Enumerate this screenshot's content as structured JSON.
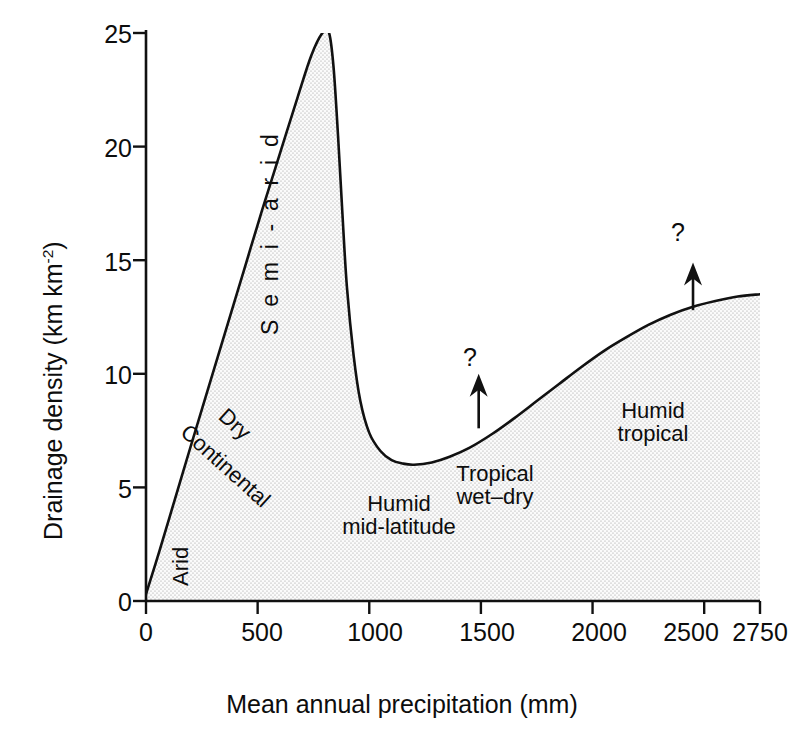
{
  "chart_data": {
    "type": "area",
    "title": "",
    "subtitle": "",
    "xlabel": "Mean annual precipitation  (mm)",
    "ylabel": "Drainage density  (km km-2)",
    "ylabel_base": "Drainage density  (km km",
    "ylabel_sup": "-2",
    "ylabel_close": ")",
    "xlim": [
      0,
      2750
    ],
    "ylim": [
      0,
      25
    ],
    "xticks": [
      0,
      500,
      1000,
      1500,
      2000,
      2500,
      2750
    ],
    "xtick_labels": [
      "0",
      "500",
      "1000",
      "1500",
      "2000",
      "2500",
      "2750"
    ],
    "yticks": [
      0,
      5,
      10,
      15,
      20,
      25
    ],
    "ytick_labels": [
      "0",
      "5",
      "10",
      "15",
      "20",
      "25"
    ],
    "grid": false,
    "legend": "none",
    "fill": "stippled-grey",
    "fill_color": "#ececec",
    "line_color": "#111111",
    "series": [
      {
        "name": "Drainage density",
        "x": [
          0,
          60,
          130,
          200,
          280,
          360,
          440,
          520,
          600,
          680,
          740,
          790,
          820,
          840,
          860,
          880,
          900,
          930,
          960,
          1000,
          1050,
          1100,
          1150,
          1200,
          1280,
          1360,
          1450,
          1550,
          1650,
          1750,
          1850,
          1950,
          2050,
          2150,
          2250,
          2350,
          2450,
          2550,
          2650,
          2750
        ],
        "y": [
          0.3,
          2.2,
          4.5,
          6.8,
          9.4,
          12.0,
          14.6,
          17.2,
          19.7,
          22.2,
          24.0,
          25.0,
          25.0,
          23.5,
          20.5,
          17.0,
          13.8,
          10.8,
          8.8,
          7.4,
          6.6,
          6.2,
          6.05,
          6.0,
          6.1,
          6.35,
          6.75,
          7.35,
          8.05,
          8.8,
          9.55,
          10.3,
          11.0,
          11.6,
          12.15,
          12.6,
          12.95,
          13.2,
          13.4,
          13.5
        ]
      }
    ],
    "annotations": [
      {
        "name": "semi-arid",
        "text": "S e m i - a r i d",
        "x": 660,
        "y": 17.0,
        "rotation": -90
      },
      {
        "name": "dry",
        "text": "Dry",
        "x": 430,
        "y": 8.0,
        "rotation": 42
      },
      {
        "name": "continental",
        "text": "Continental",
        "x": 290,
        "y": 7.2,
        "rotation": 42
      },
      {
        "name": "arid",
        "text": "Arid",
        "x": 150,
        "y": 2.4,
        "rotation": -90
      },
      {
        "name": "humid-mid-latitude",
        "text_line1": "Humid",
        "text_line2": "mid-latitude",
        "x": 1220,
        "y": 3.6,
        "rotation": 0
      },
      {
        "name": "tropical-wet-dry",
        "text_line1": "Tropical",
        "text_line2": "wet–dry",
        "x": 1720,
        "y": 4.6,
        "rotation": 0
      },
      {
        "name": "humid-tropical",
        "text_line1": "Humid",
        "text_line2": "tropical",
        "x": 2340,
        "y": 8.1,
        "rotation": 0
      },
      {
        "name": "arrow-1",
        "text": "?",
        "x": 1490,
        "y_tail": 7.6,
        "y_head": 10.0,
        "rotation": 0
      },
      {
        "name": "arrow-2",
        "text": "?",
        "x": 2450,
        "y_tail": 12.8,
        "y_head": 14.9,
        "rotation": 0
      }
    ]
  },
  "axes": {
    "y_title_base": "Drainage density  (km km",
    "y_title_sup": "-2",
    "y_title_close": ")",
    "x_title": "Mean annual precipitation  (mm)",
    "x_tick_0": "0",
    "x_tick_1": "500",
    "x_tick_2": "1000",
    "x_tick_3": "1500",
    "x_tick_4": "2000",
    "x_tick_5": "2500",
    "x_tick_6": "2750",
    "y_tick_0": "0",
    "y_tick_1": "5",
    "y_tick_2": "10",
    "y_tick_3": "15",
    "y_tick_4": "20",
    "y_tick_5": "25"
  },
  "regions": {
    "arid": "Arid",
    "dry": "Dry",
    "continental": "Continental",
    "semi_arid": "S e m i - a r i d",
    "humid_mid_latitude_1": "Humid",
    "humid_mid_latitude_2": "mid-latitude",
    "tropical_wet_dry_1": "Tropical",
    "tropical_wet_dry_2": "wet–dry",
    "humid_tropical_1": "Humid",
    "humid_tropical_2": "tropical"
  },
  "markers": {
    "question_1": "?",
    "question_2": "?"
  },
  "colors": {
    "line": "#111111",
    "fill": "#ececec",
    "stipple": "#9a9a9a",
    "text": "#0d0d0d",
    "background": "#ffffff"
  }
}
